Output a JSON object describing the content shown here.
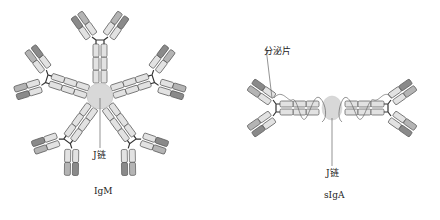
{
  "figure": {
    "panels": [
      {
        "id": "igm",
        "caption": "IgM",
        "structure": "pentamer",
        "center": [
          100,
          96
        ],
        "center_label": "J链",
        "arms": 5,
        "arm_angles_deg": [
          -90,
          -18,
          54,
          126,
          198
        ]
      },
      {
        "id": "siga",
        "caption": "sIgA",
        "structure": "dimer",
        "center": [
          332,
          108
        ],
        "center_label": "J链",
        "secretory_label": "分泌片"
      }
    ],
    "labels": {
      "igm_jchain": "J链",
      "igm_caption": "IgM",
      "siga_secretory": "分泌片",
      "siga_jchain": "J链",
      "siga_caption": "sIgA"
    },
    "colors": {
      "domain_fill": "#e2e2e2",
      "domain_stroke": "#555555",
      "variable_dark": "#8a8a8a",
      "variable_mid": "#b4b4b4",
      "jchain_fill": "#d8d8d8",
      "line": "#666666",
      "hinge": "#333333"
    }
  }
}
